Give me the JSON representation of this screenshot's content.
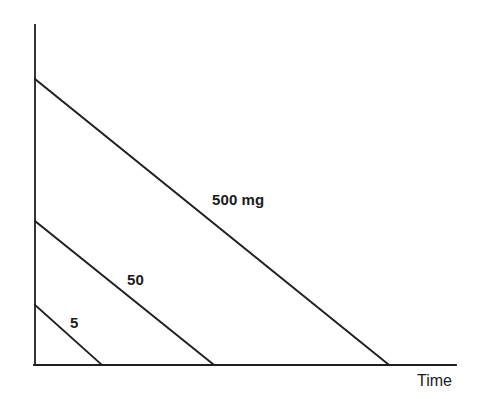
{
  "figure": {
    "width": 482,
    "height": 399,
    "background_color": "#ffffff",
    "ink_color": "#1f1f1f"
  },
  "chart_data": {
    "type": "line",
    "title": "",
    "subtitle": "",
    "xlabel": "Time",
    "ylabel": "",
    "grid": false,
    "legend": "inline-labels",
    "axes": {
      "x_axis_visible": true,
      "y_axis_visible": true,
      "x_tick_labels": [],
      "y_tick_labels": [],
      "xlim": [
        0,
        1
      ],
      "ylim": [
        0,
        1
      ],
      "note": "Unscaled schematic axes; no numeric ticks are printed"
    },
    "annotations": [
      {
        "text": "500 mg",
        "x_px": 212,
        "y_px": 192
      },
      {
        "text": "50",
        "x_px": 127,
        "y_px": 272
      },
      {
        "text": "5",
        "x_px": 70,
        "y_px": 315
      },
      {
        "text": "Time",
        "x_px": 417,
        "y_px": 373
      }
    ],
    "series": [
      {
        "name": "500 mg",
        "label": "500 mg",
        "dose_mg": 500,
        "color": "#1f1f1f",
        "style": "solid",
        "points_px": [
          [
            35,
            79
          ],
          [
            389,
            365
          ]
        ],
        "start_height_rel": 1.0,
        "end_time_rel": 1.0
      },
      {
        "name": "50",
        "label": "50",
        "dose_mg": 50,
        "color": "#1f1f1f",
        "style": "solid",
        "points_px": [
          [
            35,
            221
          ],
          [
            214,
            365
          ]
        ],
        "start_height_rel": 0.503,
        "end_time_rel": 0.505
      },
      {
        "name": "5",
        "label": "5",
        "dose_mg": 5,
        "color": "#1f1f1f",
        "style": "solid",
        "points_px": [
          [
            35,
            305
          ],
          [
            102,
            365
          ]
        ],
        "start_height_rel": 0.21,
        "end_time_rel": 0.189
      }
    ],
    "axis_geometry_px": {
      "y_axis": [
        [
          35,
          25
        ],
        [
          35,
          365
        ]
      ],
      "x_axis": [
        [
          34,
          365
        ],
        [
          456,
          365
        ]
      ]
    }
  }
}
